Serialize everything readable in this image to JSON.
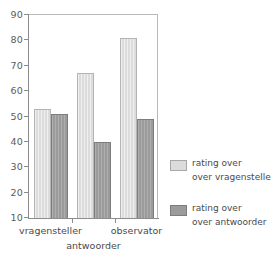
{
  "chart_data": {
    "type": "bar",
    "title": "",
    "xlabel": "antwoorder",
    "ylabel": "",
    "categories": [
      "vragensteller",
      "",
      "observator"
    ],
    "series": [
      {
        "name": "rating over over vragensteller",
        "name_line1": "rating over",
        "name_line2": "over vragensteller",
        "color": "#dcdcdc",
        "values": [
          53,
          67,
          81
        ]
      },
      {
        "name": "rating over over antwoorder",
        "name_line1": "rating over",
        "name_line2": "over antwoorder",
        "color": "#9b9b9b",
        "values": [
          51,
          40,
          49
        ]
      }
    ],
    "ylim": [
      10,
      90
    ],
    "ytick_labels": [
      "90",
      "80",
      "70",
      "60",
      "50",
      "40",
      "30",
      "20",
      "10"
    ],
    "ytick_values": [
      90,
      80,
      70,
      60,
      50,
      40,
      30,
      20,
      10
    ],
    "grid": false,
    "legend_position": "right"
  },
  "axis": {
    "y_labels": [
      "90",
      "80",
      "70",
      "60",
      "50",
      "40",
      "30",
      "20",
      "10"
    ],
    "x_labels": [
      "vragensteller",
      "observator"
    ],
    "x_title": "antwoorder"
  },
  "legend": {
    "entries": [
      {
        "line1": "rating over",
        "line2": "over vragensteller",
        "swatch": "light"
      },
      {
        "line1": "rating over",
        "line2": "over antwoorder",
        "swatch": "dark"
      }
    ]
  }
}
